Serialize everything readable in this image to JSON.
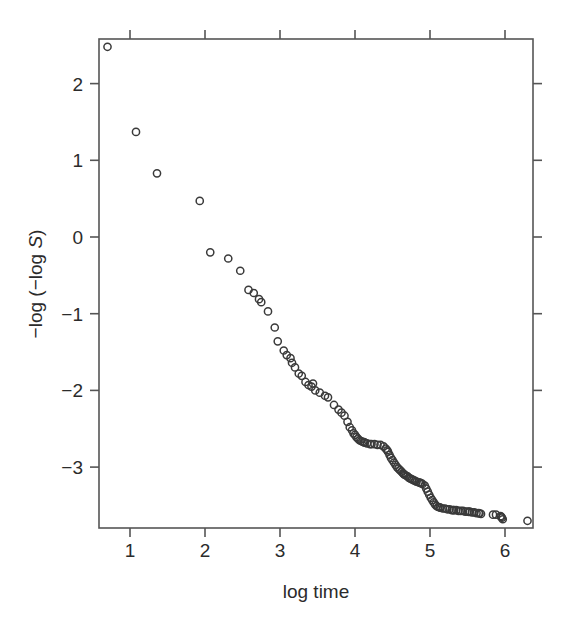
{
  "chart_data": {
    "type": "scatter",
    "title": "",
    "xlabel": "log time",
    "ylabel": "−log (−log S)",
    "ylabel_parts": {
      "prefix": "−log (−log ",
      "italic": "S",
      "suffix": ")"
    },
    "xlim": [
      0.6,
      6.45
    ],
    "ylim": [
      -3.82,
      2.6
    ],
    "xticks": [
      1,
      2,
      3,
      4,
      5,
      6
    ],
    "xtick_labels": [
      "1",
      "2",
      "3",
      "4",
      "5",
      "6"
    ],
    "yticks": [
      2,
      1,
      0,
      -1,
      -2,
      -3
    ],
    "ytick_labels": [
      "2",
      "1",
      "0",
      "−1",
      "−2",
      "−3"
    ],
    "grid": false,
    "legend": null,
    "marker": {
      "shape": "open-circle",
      "radius_px": 3.6,
      "stroke": "#3a3a3a",
      "fill": "none"
    },
    "frame_color": "#555555",
    "background": "#ffffff",
    "n_points": 118,
    "points": [
      [
        0.7,
        2.48
      ],
      [
        1.08,
        1.37
      ],
      [
        1.36,
        0.83
      ],
      [
        1.93,
        0.47
      ],
      [
        2.07,
        -0.2
      ],
      [
        2.31,
        -0.28
      ],
      [
        2.47,
        -0.44
      ],
      [
        2.58,
        -0.69
      ],
      [
        2.65,
        -0.73
      ],
      [
        2.72,
        -0.81
      ],
      [
        2.75,
        -0.85
      ],
      [
        2.84,
        -0.97
      ],
      [
        2.93,
        -1.18
      ],
      [
        2.97,
        -1.36
      ],
      [
        3.05,
        -1.48
      ],
      [
        3.09,
        -1.54
      ],
      [
        3.14,
        -1.58
      ],
      [
        3.2,
        -1.7
      ],
      [
        3.25,
        -1.78
      ],
      [
        3.29,
        -1.81
      ],
      [
        3.34,
        -1.89
      ],
      [
        3.38,
        -1.93
      ],
      [
        3.42,
        -1.95
      ],
      [
        3.47,
        -2.0
      ],
      [
        3.53,
        -2.03
      ],
      [
        3.6,
        -2.07
      ],
      [
        3.64,
        -2.09
      ],
      [
        3.72,
        -2.19
      ],
      [
        3.78,
        -2.25
      ],
      [
        3.82,
        -2.29
      ],
      [
        3.86,
        -2.33
      ],
      [
        3.9,
        -2.41
      ],
      [
        3.93,
        -2.48
      ],
      [
        3.96,
        -2.52
      ],
      [
        3.98,
        -2.56
      ],
      [
        4.0,
        -2.58
      ],
      [
        4.02,
        -2.61
      ],
      [
        4.04,
        -2.63
      ],
      [
        4.06,
        -2.65
      ],
      [
        4.08,
        -2.66
      ],
      [
        4.1,
        -2.67
      ],
      [
        4.13,
        -2.68
      ],
      [
        4.16,
        -2.69
      ],
      [
        4.2,
        -2.7
      ],
      [
        4.26,
        -2.7
      ],
      [
        4.3,
        -2.71
      ],
      [
        4.34,
        -2.71
      ],
      [
        4.38,
        -2.73
      ],
      [
        4.41,
        -2.76
      ],
      [
        4.44,
        -2.8
      ],
      [
        4.46,
        -2.84
      ],
      [
        4.48,
        -2.88
      ],
      [
        4.5,
        -2.91
      ],
      [
        4.52,
        -2.94
      ],
      [
        4.54,
        -2.97
      ],
      [
        4.56,
        -3.0
      ],
      [
        4.58,
        -3.02
      ],
      [
        4.6,
        -3.04
      ],
      [
        4.62,
        -3.06
      ],
      [
        4.64,
        -3.08
      ],
      [
        4.66,
        -3.1
      ],
      [
        4.68,
        -3.11
      ],
      [
        4.7,
        -3.12
      ],
      [
        4.72,
        -3.14
      ],
      [
        4.74,
        -3.15
      ],
      [
        4.76,
        -3.16
      ],
      [
        4.78,
        -3.17
      ],
      [
        4.8,
        -3.18
      ],
      [
        4.82,
        -3.19
      ],
      [
        4.85,
        -3.2
      ],
      [
        4.88,
        -3.21
      ],
      [
        4.9,
        -3.22
      ],
      [
        4.93,
        -3.24
      ],
      [
        4.95,
        -3.28
      ],
      [
        4.97,
        -3.32
      ],
      [
        4.99,
        -3.36
      ],
      [
        5.01,
        -3.4
      ],
      [
        5.03,
        -3.43
      ],
      [
        5.05,
        -3.46
      ],
      [
        5.07,
        -3.49
      ],
      [
        5.09,
        -3.51
      ],
      [
        5.11,
        -3.52
      ],
      [
        5.14,
        -3.53
      ],
      [
        5.17,
        -3.54
      ],
      [
        5.2,
        -3.54
      ],
      [
        5.23,
        -3.55
      ],
      [
        5.26,
        -3.55
      ],
      [
        5.29,
        -3.56
      ],
      [
        5.32,
        -3.56
      ],
      [
        5.35,
        -3.56
      ],
      [
        5.38,
        -3.57
      ],
      [
        5.41,
        -3.57
      ],
      [
        5.44,
        -3.57
      ],
      [
        5.47,
        -3.58
      ],
      [
        5.5,
        -3.58
      ],
      [
        5.53,
        -3.58
      ],
      [
        5.56,
        -3.59
      ],
      [
        5.59,
        -3.59
      ],
      [
        5.62,
        -3.6
      ],
      [
        5.65,
        -3.6
      ],
      [
        5.68,
        -3.61
      ],
      [
        5.84,
        -3.62
      ],
      [
        5.88,
        -3.62
      ],
      [
        5.94,
        -3.64
      ],
      [
        5.96,
        -3.66
      ],
      [
        5.97,
        -3.68
      ],
      [
        6.3,
        -3.7
      ],
      [
        3.16,
        -1.64
      ],
      [
        3.44,
        -1.91
      ],
      [
        4.12,
        -2.675
      ],
      [
        4.22,
        -2.7
      ],
      [
        4.43,
        -2.78
      ],
      [
        4.65,
        -3.09
      ],
      [
        4.87,
        -3.205
      ],
      [
        5.13,
        -3.525
      ],
      [
        5.31,
        -3.56
      ],
      [
        5.52,
        -3.583
      ],
      [
        5.66,
        -3.605
      ],
      [
        5.95,
        -3.65
      ]
    ]
  }
}
